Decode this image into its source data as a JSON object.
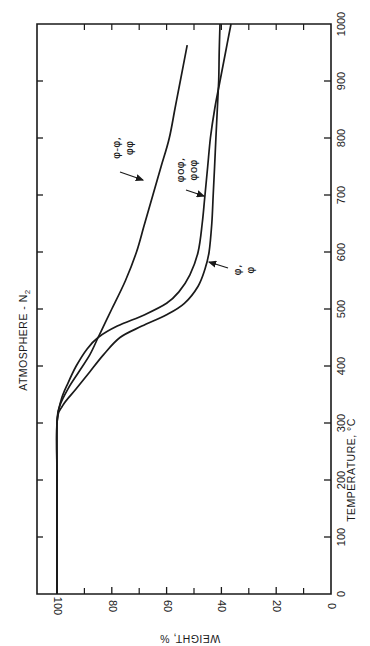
{
  "chart_data": {
    "type": "line",
    "orientation": "rotated 90 degrees counter-clockwise (temperature axis runs vertically on the right, weight axis runs horizontally along the bottom, labels read upside-down / sideways)",
    "title": "ATMOSPHERE - N2",
    "title_display": "ATMOSPHERE - N",
    "title_subscript": "2",
    "xlabel": "TEMPERATURE, °C",
    "ylabel": "WEIGHT, %",
    "xlim": [
      0,
      1000
    ],
    "ylim": [
      0,
      100
    ],
    "x_ticks": [
      0,
      100,
      200,
      300,
      400,
      500,
      600,
      700,
      800,
      900,
      1000
    ],
    "x_tick_labels": [
      "0",
      "100",
      "200",
      "300",
      "400",
      "500",
      "600",
      "700",
      "800",
      "900",
      "1000"
    ],
    "y_ticks": [
      0,
      20,
      40,
      60,
      80,
      100
    ],
    "y_tick_labels": [
      "0",
      "20",
      "40",
      "60",
      "80",
      "100"
    ],
    "y_minor_ticks": [
      10,
      30,
      50,
      70,
      90
    ],
    "grid": false,
    "legend": "none (curves labeled directly with arrows)",
    "series": [
      {
        "name": "φ-φ, φφ",
        "label_lines": [
          "φ-φ,",
          "φφ"
        ],
        "x": [
          0,
          100,
          200,
          300,
          330,
          360,
          390,
          420,
          450,
          480,
          500,
          550,
          600,
          650,
          700,
          750,
          800,
          850,
          900,
          963
        ],
        "values": [
          100,
          100,
          100,
          100,
          99,
          96,
          92,
          88,
          85,
          82,
          80,
          75,
          71,
          68,
          65,
          62,
          59,
          57,
          55,
          52.5
        ]
      },
      {
        "name": "φoφ, φoφ",
        "label_lines": [
          "φoφ,",
          "φoφ"
        ],
        "x": [
          0,
          100,
          200,
          300,
          340,
          370,
          400,
          430,
          450,
          470,
          490,
          510,
          530,
          560,
          600,
          650,
          700,
          750,
          800,
          850,
          900,
          950,
          1000
        ],
        "values": [
          100,
          100,
          100,
          100,
          98.5,
          96,
          93,
          89,
          85,
          78,
          68,
          60,
          55.5,
          51.5,
          48.5,
          47,
          46,
          45,
          44,
          42.5,
          40.5,
          38.5,
          36.5
        ]
      },
      {
        "name": "φ,φ",
        "label_lines": [
          "φ,",
          "φ"
        ],
        "x": [
          0,
          100,
          200,
          300,
          330,
          360,
          390,
          420,
          450,
          470,
          490,
          510,
          540,
          570,
          600,
          650,
          700,
          750,
          800,
          850,
          900,
          950,
          1000
        ],
        "values": [
          100,
          100,
          100,
          100,
          98,
          93,
          88,
          83,
          77,
          69,
          60,
          53.5,
          48.5,
          46,
          44.5,
          43.5,
          43,
          42.5,
          42,
          41.5,
          41,
          40.8,
          40.5
        ]
      }
    ]
  },
  "annotations": [
    {
      "text_lines": [
        "φ-φ,",
        "φφ"
      ],
      "points_to": "φ-φ, φφ",
      "arrow": true
    },
    {
      "text_lines": [
        "φoφ,",
        "φoφ"
      ],
      "points_to": "φoφ, φoφ",
      "arrow": true
    },
    {
      "text_lines": [
        "φ,",
        "φ"
      ],
      "points_to": "φ,φ",
      "arrow": true
    }
  ],
  "colors": {
    "ink": "#1a1a1a",
    "background": "#ffffff"
  }
}
